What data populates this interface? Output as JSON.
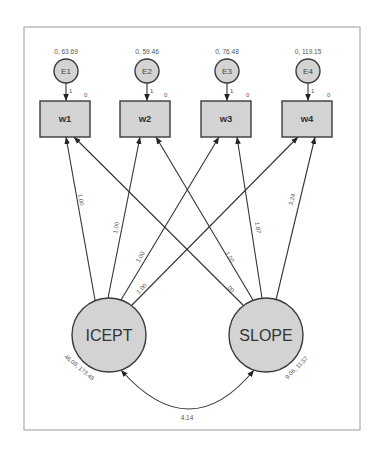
{
  "diagram": {
    "type": "structural-equation-model-path-diagram",
    "colors": {
      "node_fill": "#d3d3d3",
      "node_stroke": "#3a3a3a",
      "edge": "#333333",
      "label": "#555555",
      "frame": "#9a9a9a"
    },
    "error_terms": [
      {
        "name": "E1",
        "params": "0, 63.69",
        "path_weight": "1"
      },
      {
        "name": "E2",
        "params": "0, 59.46",
        "path_weight": "1"
      },
      {
        "name": "E3",
        "params": "0, 76.48",
        "path_weight": "1"
      },
      {
        "name": "E4",
        "params": "0, 119.15",
        "path_weight": "1"
      }
    ],
    "observed": [
      {
        "name": "w1",
        "intercept": "0"
      },
      {
        "name": "w2",
        "intercept": "0"
      },
      {
        "name": "w3",
        "intercept": "0"
      },
      {
        "name": "w4",
        "intercept": "0"
      }
    ],
    "latent": {
      "icept": {
        "name": "ICEPT",
        "params": "46.08, 173.48"
      },
      "slope": {
        "name": "SLOPE",
        "params": "9.06, 11.57"
      }
    },
    "loadings": {
      "icept": [
        {
          "to": "w1",
          "value": "1.00"
        },
        {
          "to": "w2",
          "value": "1.00"
        },
        {
          "to": "w3",
          "value": "1.00"
        },
        {
          "to": "w4",
          "value": "1.00"
        }
      ],
      "slope": [
        {
          "to": "w1",
          "value": ".00"
        },
        {
          "to": "w2",
          "value": "1.00"
        },
        {
          "to": "w3",
          "value": "1.87"
        },
        {
          "to": "w4",
          "value": "3.24"
        }
      ]
    },
    "covariance": {
      "between": [
        "ICEPT",
        "SLOPE"
      ],
      "value": "4.14"
    }
  }
}
